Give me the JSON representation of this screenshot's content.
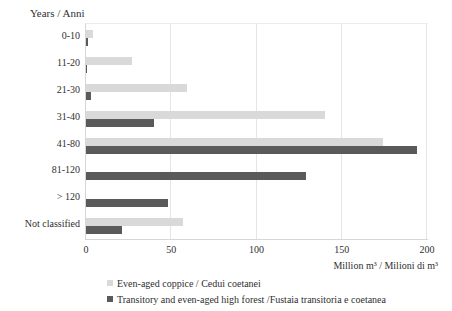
{
  "chart_data": {
    "type": "bar",
    "orientation": "horizontal",
    "title": "Years / Anni",
    "xlabel": "Million m³ / Milioni di m³",
    "categories": [
      "0-10",
      "11-20",
      "21-30",
      "31-40",
      "41-80",
      "81-120",
      "> 120",
      "Not classified"
    ],
    "series": [
      {
        "name": "Even-aged coppice / Cedui coetanei",
        "color": "#d9d9d9",
        "values": [
          4,
          27,
          59,
          140,
          174,
          0,
          0,
          57
        ]
      },
      {
        "name": "Transitory and even-aged high forest /Fustaia transitoria e coetanea",
        "color": "#5a5a5a",
        "values": [
          1,
          0.5,
          3,
          40,
          194,
          129,
          48,
          21
        ]
      }
    ],
    "xlim": [
      0,
      200
    ],
    "xticks": [
      0,
      50,
      100,
      150,
      200
    ],
    "grid": "vertical",
    "legend_position": "bottom-left",
    "background_color": "#ffffff"
  }
}
